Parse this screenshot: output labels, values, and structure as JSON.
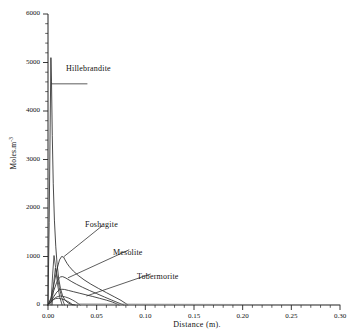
{
  "chart_data": {
    "type": "line",
    "title": "",
    "subtitle": "",
    "xlabel": "Distance (m).",
    "ylabel": "Moles.m",
    "ylabel_superscript": "-3",
    "xlim": [
      0.0,
      0.3
    ],
    "ylim": [
      0,
      6000
    ],
    "xticks": [
      0.0,
      0.05,
      0.1,
      0.15,
      0.2,
      0.25,
      0.3
    ],
    "xticklabels": [
      "0.00",
      "0.05",
      "0.10",
      "0.15",
      "0.20",
      "0.25",
      "0.30"
    ],
    "x_minor_step": 0.01,
    "yticks": [
      0,
      1000,
      2000,
      3000,
      4000,
      5000,
      6000
    ],
    "yticklabels": [
      "0",
      "1000",
      "2000",
      "3000",
      "4000",
      "5000",
      "6000"
    ],
    "y_minor_step": 200,
    "grid": false,
    "legend": "none",
    "annotations": [
      {
        "label": "Hillebrandite",
        "x": 0.0405,
        "y": 4560,
        "leader_to_x": 0.0035,
        "leader_to_y": 4560
      },
      {
        "label": "Foshagite",
        "x": 0.0555,
        "y": 1630,
        "leader_to_x": 0.0165,
        "leader_to_y": 1000
      },
      {
        "label": "Mesolite",
        "x": 0.0835,
        "y": 1140,
        "leader_to_x": 0.0205,
        "leader_to_y": 560
      },
      {
        "label": "Tobermorite",
        "x": 0.1055,
        "y": 640,
        "leader_to_x": 0.0395,
        "leader_to_y": 185
      }
    ],
    "series": [
      {
        "name": "Hillebrandite",
        "color": "#2b2b2b",
        "x": [
          0.0,
          0.0012,
          0.0022,
          0.003,
          0.0036,
          0.0044,
          0.0054,
          0.0066,
          0.008,
          0.0094,
          0.011,
          0.0128,
          0.015,
          0.0175,
          0.0205,
          0.024,
          0.028
        ],
        "y": [
          0,
          1700,
          3650,
          5100,
          4600,
          3500,
          2500,
          1750,
          1200,
          830,
          540,
          340,
          190,
          100,
          45,
          12,
          0
        ]
      },
      {
        "name": "Foshagite",
        "color": "#2b2b2b",
        "x": [
          0.0,
          0.003,
          0.006,
          0.009,
          0.0118,
          0.014,
          0.016,
          0.0175,
          0.0195,
          0.022,
          0.026,
          0.031,
          0.037,
          0.044,
          0.052,
          0.06,
          0.068,
          0.075,
          0.08,
          0.082
        ],
        "y": [
          0,
          140,
          420,
          720,
          930,
          1000,
          990,
          930,
          860,
          790,
          700,
          610,
          520,
          430,
          340,
          255,
          170,
          95,
          30,
          0
        ]
      },
      {
        "name": "Mesolite",
        "color": "#2b2b2b",
        "x": [
          0.0,
          0.003,
          0.006,
          0.009,
          0.011,
          0.013,
          0.015,
          0.0175,
          0.0205,
          0.0245,
          0.0295,
          0.0355,
          0.0425,
          0.05,
          0.058,
          0.065,
          0.071,
          0.0755,
          0.078
        ],
        "y": [
          0,
          120,
          300,
          470,
          545,
          580,
          585,
          565,
          530,
          480,
          425,
          365,
          300,
          235,
          165,
          105,
          55,
          18,
          0
        ]
      },
      {
        "name": "Tobermorite",
        "color": "#2b2b2b",
        "x": [
          0.0,
          0.003,
          0.006,
          0.009,
          0.0115,
          0.014,
          0.017,
          0.021,
          0.026,
          0.032,
          0.039,
          0.046,
          0.053,
          0.06,
          0.066,
          0.07,
          0.073
        ],
        "y": [
          0,
          75,
          175,
          265,
          310,
          325,
          320,
          300,
          275,
          245,
          210,
          175,
          138,
          100,
          62,
          28,
          0
        ]
      },
      {
        "name": "unlabeled-curve-1",
        "color": "#3a3a3a",
        "x": [
          0.0,
          0.0025,
          0.005,
          0.0075,
          0.01,
          0.0125,
          0.015,
          0.018,
          0.0215,
          0.025,
          0.0285,
          0.031,
          0.033
        ],
        "y": [
          0,
          45,
          105,
          150,
          175,
          185,
          180,
          165,
          140,
          105,
          65,
          28,
          0
        ]
      },
      {
        "name": "unlabeled-curve-2",
        "color": "#3a3a3a",
        "x": [
          0.0,
          0.002,
          0.004,
          0.006,
          0.008,
          0.0105,
          0.0135,
          0.017,
          0.0205,
          0.0235,
          0.0255
        ],
        "y": [
          0,
          35,
          80,
          115,
          132,
          138,
          128,
          105,
          72,
          35,
          0
        ]
      },
      {
        "name": "unlabeled-spike-1",
        "color": "#3a3a3a",
        "x": [
          0.003,
          0.0048,
          0.0062,
          0.0078,
          0.0098,
          0.012,
          0.0145
        ],
        "y": [
          0,
          640,
          1020,
          780,
          430,
          170,
          0
        ]
      },
      {
        "name": "unlabeled-spike-2",
        "color": "#3a3a3a",
        "x": [
          0.0042,
          0.006,
          0.0076,
          0.0094,
          0.0116,
          0.0142,
          0.017
        ],
        "y": [
          0,
          480,
          760,
          600,
          360,
          150,
          0
        ]
      },
      {
        "name": "baseline-tail",
        "color": "#8d8d8d",
        "x": [
          0.03,
          0.06,
          0.09,
          0.12,
          0.15,
          0.18,
          0.21,
          0.24,
          0.27,
          0.3
        ],
        "y": [
          22,
          20,
          18,
          16,
          14,
          12,
          10,
          9,
          8,
          7
        ]
      }
    ]
  },
  "axis": {
    "x_title": "Distance (m).",
    "y_title_text": "Moles.m",
    "y_title_sup": "-3"
  }
}
